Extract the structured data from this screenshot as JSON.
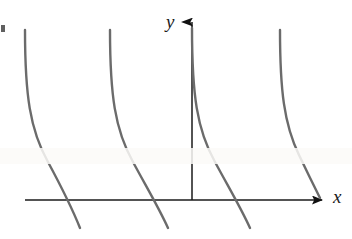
{
  "figure": {
    "background_color": "#ffffff",
    "width": 352,
    "height": 239
  },
  "axes": {
    "x_axis": {
      "label": "x",
      "color": "#1a1a1a",
      "y_pixel": 200,
      "x_start": 25,
      "x_end": 325,
      "arrow": "right"
    },
    "y_axis": {
      "label": "y",
      "color": "#1a1a1a",
      "x_pixel": 192,
      "y_start": 200,
      "y_end": 18,
      "arrow": "up"
    },
    "origin": {
      "x": 192,
      "y": 200
    }
  },
  "chart_data": {
    "type": "line",
    "title": "",
    "xlabel": "x",
    "ylabel": "y",
    "grid": false,
    "legend": false,
    "curve_color": "#6b6b6b",
    "period_px": 85,
    "asymptotes_px": [
      25,
      110,
      192,
      280
    ],
    "series": [
      {
        "name": "branch-1",
        "asymptote_x": 25,
        "path": "M 25 30 C 25 95, 30 130, 48 162 C 62 188, 72 208, 80 228"
      },
      {
        "name": "branch-2",
        "asymptote_x": 110,
        "path": "M 110 30 C 110 95, 115 130, 133 162 C 147 188, 159 208, 168 228"
      },
      {
        "name": "branch-3",
        "asymptote_x": 192,
        "path": "M 192 28 C 192 95, 197 130, 215 162 C 229 188, 241 208, 250 228"
      },
      {
        "name": "branch-4",
        "asymptote_x": 280,
        "path": "M 280 30 C 280 90, 284 124, 299 155 C 309 176, 315 188, 320 198"
      }
    ]
  }
}
